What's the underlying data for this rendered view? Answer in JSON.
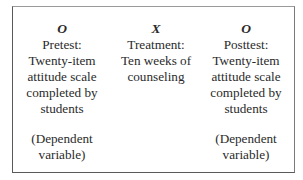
{
  "diagram": {
    "type": "one-group pretest-posttest design",
    "columns": [
      {
        "symbol": "O",
        "lines": [
          "Pretest:",
          "Twenty-item",
          "attitude scale",
          "completed by",
          "students"
        ],
        "note_lines": [
          "(Dependent",
          "variable)"
        ]
      },
      {
        "symbol": "X",
        "lines": [
          "Treatment:",
          "Ten weeks of",
          "counseling"
        ],
        "note_lines": []
      },
      {
        "symbol": "O",
        "lines": [
          "Posttest:",
          "Twenty-item",
          "attitude scale",
          "completed by",
          "students"
        ],
        "note_lines": [
          "(Dependent",
          "variable)"
        ]
      }
    ]
  }
}
